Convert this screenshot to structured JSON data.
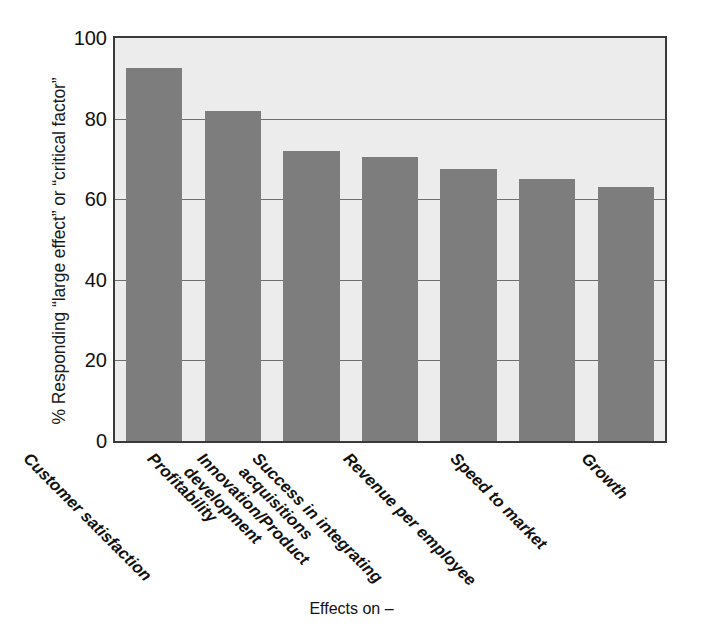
{
  "chart_data": {
    "type": "bar",
    "title": "",
    "xlabel": "Effects on –",
    "ylabel": "% Responding “large effect” or “critical factor”",
    "categories": [
      "Customer satisfaction",
      "Profitability",
      "Innovation/Product\ndevelopment",
      "Success in integrating\nacquisitions",
      "Revenue per employee",
      "Speed to market",
      "Growth"
    ],
    "values": [
      92.5,
      82,
      72,
      70.5,
      67.5,
      65,
      63
    ],
    "ylim": [
      0,
      100
    ],
    "yticks": [
      0,
      20,
      40,
      60,
      80,
      100
    ],
    "ytick_labels": [
      "0",
      "20",
      "40",
      "60",
      "80",
      "100"
    ],
    "grid": true,
    "grid_axis": "y",
    "legend": "none",
    "bar_color": "#7d7d7d",
    "plot_background": "#ececec",
    "axis_color": "#3a3a3a",
    "gridline_color": "#6f6f6f",
    "xtick_rotation": 45
  },
  "axis": {
    "y_title": "% Responding “large effect” or “critical factor”",
    "x_title": "Effects on –"
  }
}
